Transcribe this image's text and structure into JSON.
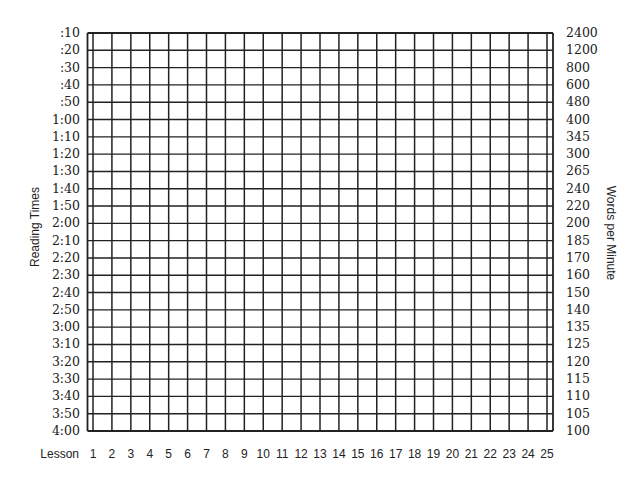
{
  "chart_data": {
    "type": "table",
    "title": "",
    "xlabel": "Lesson",
    "ylabel_left": "Reading Times",
    "ylabel_right": "Words per Minute",
    "categories": [
      "1",
      "2",
      "3",
      "4",
      "5",
      "6",
      "7",
      "8",
      "9",
      "10",
      "11",
      "12",
      "13",
      "14",
      "15",
      "16",
      "17",
      "18",
      "19",
      "20",
      "21",
      "22",
      "23",
      "24",
      "25"
    ],
    "y_left_ticks": [
      ":10",
      ":20",
      ":30",
      ":40",
      ":50",
      "1:00",
      "1:10",
      "1:20",
      "1:30",
      "1:40",
      "1:50",
      "2:00",
      "2:10",
      "2:20",
      "2:30",
      "2:40",
      "2:50",
      "3:00",
      "3:10",
      "3:20",
      "3:30",
      "3:40",
      "3:50",
      "4:00"
    ],
    "y_right_ticks": [
      "2400",
      "1200",
      "800",
      "600",
      "480",
      "400",
      "345",
      "300",
      "265",
      "240",
      "220",
      "200",
      "185",
      "170",
      "160",
      "150",
      "140",
      "135",
      "125",
      "120",
      "115",
      "110",
      "105",
      "100"
    ],
    "series": [],
    "grid": true,
    "legend": null
  },
  "axes": {
    "left_title": "Reading Times",
    "right_title": "Words per Minute",
    "bottom_title": "Lesson"
  },
  "colors": {
    "grid_line": "#222222",
    "text": "#222222",
    "background": "#ffffff"
  }
}
